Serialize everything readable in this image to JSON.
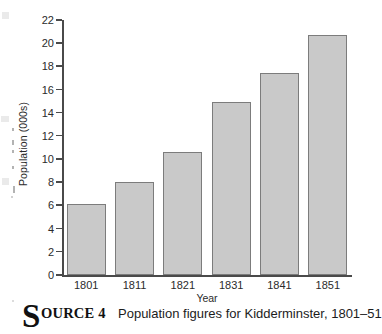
{
  "chart_data": {
    "type": "bar",
    "title": "",
    "categories": [
      "1801",
      "1811",
      "1821",
      "1831",
      "1841",
      "1851"
    ],
    "values": [
      6.1,
      8.0,
      10.6,
      14.9,
      17.4,
      20.7
    ],
    "xlabel": "Year",
    "ylabel": "Population (000s)",
    "ylim": [
      0,
      22
    ],
    "yticks": [
      "0",
      "2",
      "4",
      "6",
      "8",
      "10",
      "12",
      "14",
      "16",
      "18",
      "20",
      "22"
    ],
    "ytick_step": 2,
    "grid": false,
    "legend": null,
    "bar_fill_color": "#c9c9c9",
    "bar_border_color": "#7c7c7c",
    "axis_color": "#4a4a4a"
  },
  "caption": {
    "dropcap": "S",
    "smallcaps": "OURCE 4",
    "text": "Population figures for Kidderminster, 1801–51"
  }
}
